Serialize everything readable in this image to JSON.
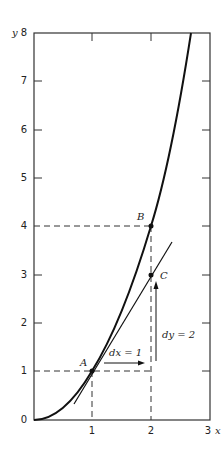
{
  "figure": {
    "axis_labels": {
      "x": "x",
      "y": "y"
    },
    "y_ticks": [
      "0",
      "1",
      "2",
      "3",
      "4",
      "5",
      "6",
      "7",
      "8"
    ],
    "x_ticks": [
      "1",
      "2",
      "3"
    ],
    "points": {
      "A": {
        "label": "A",
        "x": 1,
        "y": 1
      },
      "B": {
        "label": "B",
        "x": 2,
        "y": 4
      },
      "C": {
        "label": "C",
        "x": 2,
        "y": 3
      }
    },
    "annotations": {
      "dx": "dx = 1",
      "dy": "dy = 2"
    },
    "curve": "y = x^2",
    "tangent_at": "A",
    "colors": {
      "line": "#222222",
      "background": "#ffffff"
    }
  }
}
